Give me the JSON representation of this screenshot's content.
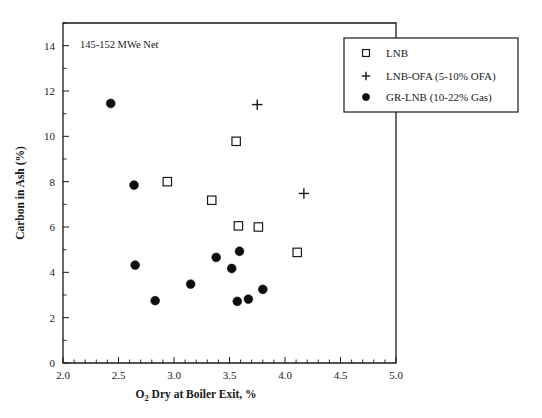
{
  "figure": {
    "annotation": "145-152 MWe Net",
    "background": "#ffffff",
    "ink_color": "#1a1a1a"
  },
  "legend": {
    "position": "top-right",
    "items": [
      {
        "label": "LNB",
        "marker": "open-square"
      },
      {
        "label": "LNB-OFA (5-10% OFA)",
        "marker": "plus"
      },
      {
        "label": "GR-LNB (10-22% Gas)",
        "marker": "filled-circle"
      }
    ]
  },
  "axes": {
    "x": {
      "title_main": "O",
      "title_sub": "2",
      "title_rest": " Dry at Boiler Exit, %",
      "title_full": "O2 Dry at Boiler Exit, %",
      "ticks": [
        "2.0",
        "2.5",
        "3.0",
        "3.5",
        "4.0",
        "4.5",
        "5.0"
      ],
      "min": 2.0,
      "max": 5.0
    },
    "y": {
      "title": "Carbon in Ash (%)",
      "ticks": [
        "0",
        "2",
        "4",
        "6",
        "8",
        "10",
        "12",
        "14"
      ],
      "min": 0,
      "max": 15
    }
  },
  "chart_data": {
    "type": "scatter",
    "title": "",
    "xlabel": "O2 Dry at Boiler Exit, %",
    "ylabel": "Carbon in Ash (%)",
    "xlim": [
      2.0,
      5.0
    ],
    "ylim": [
      0,
      15
    ],
    "xticks": [
      2.0,
      2.5,
      3.0,
      3.5,
      4.0,
      4.5,
      5.0
    ],
    "yticks": [
      0,
      2,
      4,
      6,
      8,
      10,
      12,
      14
    ],
    "grid": false,
    "legend_position": "top-right",
    "annotations": [
      {
        "text": "145-152 MWe Net",
        "x": 2.25,
        "y": 14.1
      }
    ],
    "series": [
      {
        "name": "LNB",
        "marker": "open-square",
        "points": [
          {
            "x": 2.94,
            "y": 8.0
          },
          {
            "x": 3.34,
            "y": 7.18
          },
          {
            "x": 3.56,
            "y": 9.78
          },
          {
            "x": 3.58,
            "y": 6.05
          },
          {
            "x": 3.76,
            "y": 6.0
          },
          {
            "x": 4.11,
            "y": 4.88
          }
        ]
      },
      {
        "name": "LNB-OFA (5-10% OFA)",
        "marker": "plus",
        "points": [
          {
            "x": 3.75,
            "y": 11.4
          },
          {
            "x": 4.17,
            "y": 7.48
          }
        ]
      },
      {
        "name": "GR-LNB (10-22% Gas)",
        "marker": "filled-circle",
        "points": [
          {
            "x": 2.43,
            "y": 11.45
          },
          {
            "x": 2.64,
            "y": 7.85
          },
          {
            "x": 2.65,
            "y": 4.32
          },
          {
            "x": 2.83,
            "y": 2.75
          },
          {
            "x": 3.15,
            "y": 3.48
          },
          {
            "x": 3.38,
            "y": 4.66
          },
          {
            "x": 3.52,
            "y": 4.17
          },
          {
            "x": 3.59,
            "y": 4.93
          },
          {
            "x": 3.57,
            "y": 2.72
          },
          {
            "x": 3.67,
            "y": 2.82
          },
          {
            "x": 3.8,
            "y": 3.25
          }
        ]
      }
    ]
  }
}
